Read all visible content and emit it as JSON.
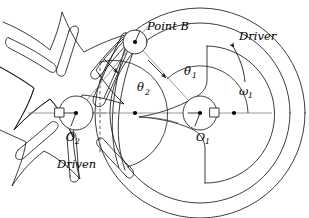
{
  "figure": {
    "title_visible": false,
    "type": "geneva-mechanism-kinematic-diagram",
    "labels": {
      "point_b": "Point B",
      "driver": "Driver",
      "driven": "Driven",
      "pivot_driver": "O",
      "pivot_driver_sub": "1",
      "pivot_driven": "O",
      "pivot_driven_sub": "2",
      "theta_driver": "θ",
      "theta_driver_sub": "1",
      "theta_driven": "θ",
      "theta_driven_sub": "2",
      "omega_driver": "ω",
      "omega_driver_sub": "1"
    },
    "colors": {
      "outline": "#1a1a1a",
      "soft_outline": "#555555",
      "centerline": "#777777",
      "link_line": "#8c8c8c",
      "background": "#ffffff"
    },
    "geometry": {
      "o1_center_px": [
        200,
        113
      ],
      "o2_center_px": [
        76,
        113
      ],
      "point_b_px": [
        135,
        42
      ],
      "driver_outer_radius_px": 108,
      "driver_inner_radius_px": 92,
      "driver_cam_radius_px": 66,
      "hub_radius_px": 17,
      "pin_radius_px": 12,
      "centerline_y_px": 113,
      "centerline_x_start_px": 28,
      "centerline_x_end_px": 272,
      "driven_arm_count": 6
    }
  }
}
